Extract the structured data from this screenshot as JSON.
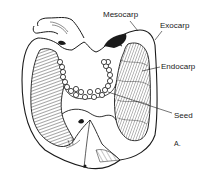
{
  "figure": {
    "panel_label": "A.",
    "labels": [
      {
        "id": "mesocarp",
        "text": "Mesocarp"
      },
      {
        "id": "exocarp",
        "text": "Exocarp"
      },
      {
        "id": "endocarp",
        "text": "Endocarp"
      },
      {
        "id": "seed",
        "text": "Seed"
      }
    ]
  },
  "colors": {
    "ink": "#1a1a1a",
    "background": "#ffffff"
  }
}
